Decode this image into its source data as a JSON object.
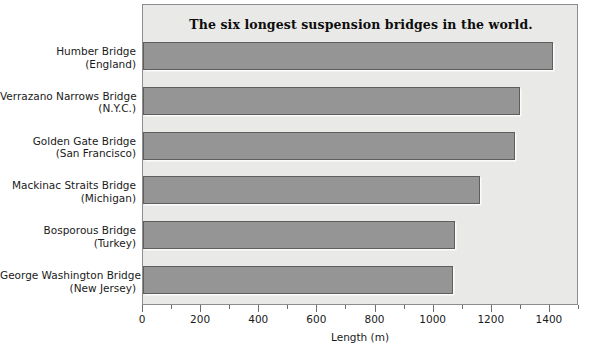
{
  "chart_data": {
    "type": "bar",
    "orientation": "horizontal",
    "title": "The six longest suspension bridges in the world.",
    "xlabel": "Length (m)",
    "ylabel": "",
    "xlim": [
      0,
      1500
    ],
    "grid": false,
    "legend": null,
    "xticks": [
      0,
      200,
      400,
      600,
      800,
      1000,
      1200,
      1400
    ],
    "xtick_labels": [
      "0",
      "200",
      "400",
      "600",
      "800",
      "1000",
      "1200",
      "1400"
    ],
    "minor_tick_interval": 100,
    "categories": [
      "Humber Bridge (England)",
      "Verrazano Narrows Bridge (N.Y.C.)",
      "Golden Gate Bridge (San Francisco)",
      "Mackinac Straits Bridge (Michigan)",
      "Bosporous Bridge (Turkey)",
      "George Washington Bridge (New Jersey)"
    ],
    "values": [
      1410,
      1298,
      1280,
      1158,
      1074,
      1067
    ],
    "bars": [
      {
        "name": "Humber Bridge",
        "location": "(England)",
        "value": 1410
      },
      {
        "name": "Verrazano Narrows Bridge",
        "location": "(N.Y.C.)",
        "value": 1298
      },
      {
        "name": "Golden Gate Bridge",
        "location": "(San Francisco)",
        "value": 1280
      },
      {
        "name": "Mackinac Straits Bridge",
        "location": "(Michigan)",
        "value": 1158
      },
      {
        "name": "Bosporous Bridge",
        "location": "(Turkey)",
        "value": 1074
      },
      {
        "name": "George Washington Bridge",
        "location": "(New Jersey)",
        "value": 1067
      }
    ],
    "colors": {
      "bar_fill": "#959595",
      "bar_edge": "#5e5e5e",
      "plot_background": "#e9e9e7",
      "frame": "#8d8d8d",
      "text": "#1a1a1a"
    }
  }
}
